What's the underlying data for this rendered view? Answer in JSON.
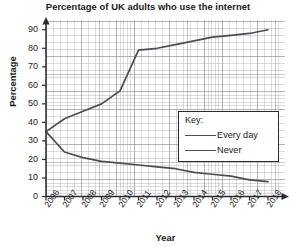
{
  "chart_data": {
    "type": "line",
    "title": "Percentage of UK adults who use the internet",
    "xlabel": "Year",
    "ylabel": "Percentage",
    "grid": true,
    "legend_position": "center-right",
    "legend_title": "Key:",
    "xlim": [
      2006,
      2018
    ],
    "ylim": [
      0,
      95
    ],
    "yticks": [
      0,
      10,
      20,
      30,
      40,
      50,
      60,
      70,
      80,
      90
    ],
    "categories": [
      2006,
      2007,
      2008,
      2009,
      2010,
      2011,
      2012,
      2013,
      2014,
      2015,
      2016,
      2017,
      2018
    ],
    "xtick_labels": [
      "2006",
      "2007",
      "2008",
      "2009",
      "2010",
      "2011",
      "2012",
      "2013",
      "2014",
      "2015",
      "2016",
      "2017",
      "2018"
    ],
    "series": [
      {
        "name": "Every day",
        "color": "#4c4c52",
        "values": [
          35,
          42,
          46,
          50,
          57,
          79,
          80,
          82,
          84,
          86,
          87,
          88,
          90
        ]
      },
      {
        "name": "Never",
        "color": "#4c4c52",
        "values": [
          35,
          24,
          21,
          19,
          18,
          17,
          16,
          15,
          13,
          12,
          11,
          9,
          8
        ]
      }
    ]
  },
  "legend": {
    "title": "Key:",
    "entries": [
      {
        "label": "Every day"
      },
      {
        "label": "Never"
      }
    ]
  },
  "colors": {
    "line": "#4c4c52",
    "axis": "#2b2b2e",
    "grid_major": "#8c8c96",
    "grid_minor": "#a5a8b2",
    "text": "#1c1c1c",
    "background": "#ffffff"
  }
}
